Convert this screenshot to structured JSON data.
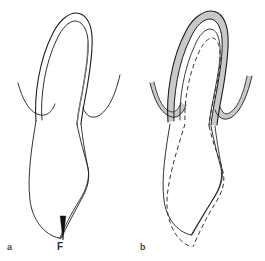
{
  "figure": {
    "type": "line-diagram",
    "width": 265,
    "height": 261,
    "background_color": "#ffffff",
    "stroke_color": "#1c1c1c",
    "shade_color": "#c9c9c9",
    "dashed_color": "#2b2b2b",
    "panels": [
      {
        "id": "a",
        "label": "a",
        "description": "Outline-only cross-section with downward arrow annotation",
        "has_shading": false,
        "has_dashed_overlay": true,
        "annotations": [
          {
            "name": "force-arrow",
            "label": "F",
            "direction": "down",
            "tip_x": 63,
            "tip_y": 238,
            "tail_y": 215
          }
        ]
      },
      {
        "id": "b",
        "label": "b",
        "description": "Same cross-section with gray shaded band and dashed deformed outline",
        "has_shading": true,
        "has_dashed_overlay": true,
        "annotations": []
      }
    ]
  },
  "labels": {
    "panel_a": "a",
    "panel_b": "b",
    "force": "F"
  },
  "colors": {
    "stroke": "#1c1c1c",
    "shade": "#c9c9c9",
    "dash": "#2b2b2b",
    "label": "#4a4a4a",
    "background": "#ffffff"
  }
}
